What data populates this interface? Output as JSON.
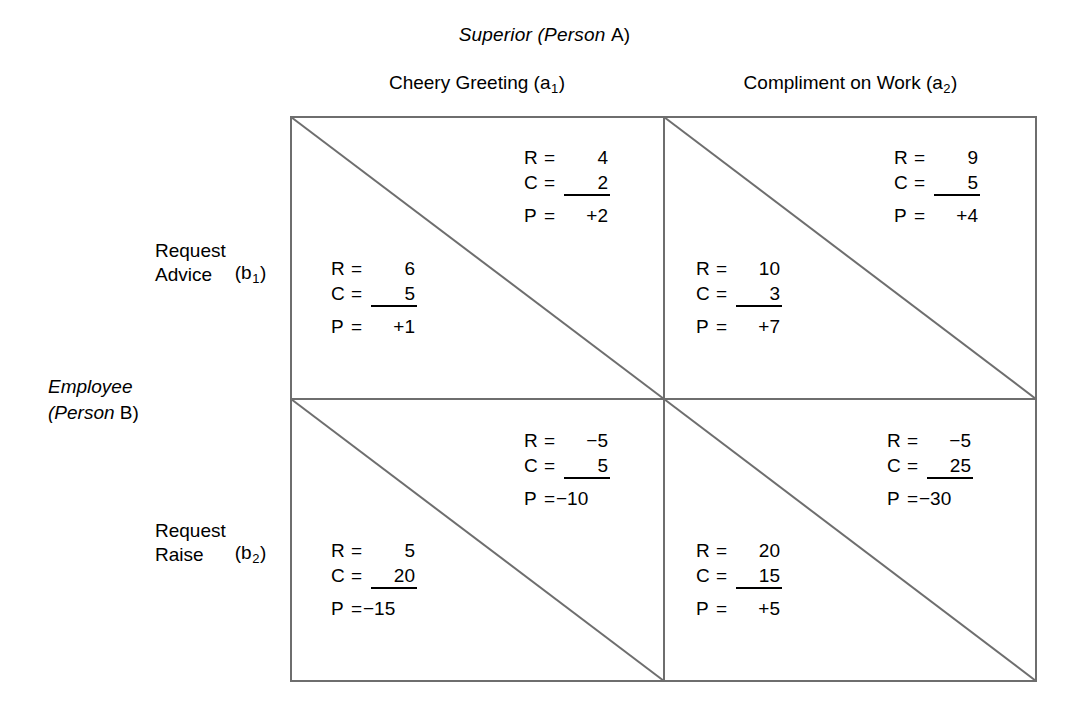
{
  "diagram": {
    "type": "payoff-matrix",
    "top_title": {
      "italic_part": "Superior (Person",
      "upright_part": "A",
      "close_paren": ")"
    },
    "side_title": {
      "line1": "Employee",
      "line2_open": "(Person",
      "line2_upright": "B",
      "line2_close": ")"
    },
    "columns": [
      {
        "key": "a1",
        "label": "Cheery Greeting (a",
        "sub": "1",
        "label_tail": ")"
      },
      {
        "key": "a2",
        "label": "Compliment on Work (a",
        "sub": "2",
        "label_tail": ")"
      }
    ],
    "rows": [
      {
        "key": "b1",
        "line1": "Request",
        "line2": "Advice",
        "tag_open": "(b",
        "sub": "1",
        "tag_close": ")"
      },
      {
        "key": "b2",
        "line1": "Request",
        "line2": "Raise",
        "tag_open": "(b",
        "sub": "2",
        "tag_close": ")"
      }
    ],
    "labels": {
      "R": "R",
      "C": "C",
      "P": "P",
      "equals": "="
    },
    "cells": [
      {
        "row": "b1",
        "col": "a1",
        "upper": {
          "player": "A",
          "R": "4",
          "C": "2",
          "P": "+2"
        },
        "lower": {
          "player": "B",
          "R": "6",
          "C": "5",
          "P": "+1"
        }
      },
      {
        "row": "b1",
        "col": "a2",
        "upper": {
          "player": "A",
          "R": "9",
          "C": "5",
          "P": "+4"
        },
        "lower": {
          "player": "B",
          "R": "10",
          "C": "3",
          "P": "+7"
        }
      },
      {
        "row": "b2",
        "col": "a1",
        "upper": {
          "player": "A",
          "R": "−5",
          "C": "5",
          "P": "−10"
        },
        "lower": {
          "player": "B",
          "R": "5",
          "C": "20",
          "P": "−15"
        }
      },
      {
        "row": "b2",
        "col": "a2",
        "upper": {
          "player": "A",
          "R": "−5",
          "C": "25",
          "P": "−30"
        },
        "lower": {
          "player": "B",
          "R": "20",
          "C": "15",
          "P": "+5"
        }
      }
    ],
    "colors": {
      "line": "#6e6e6e",
      "text": "#000000",
      "background": "#ffffff"
    }
  }
}
